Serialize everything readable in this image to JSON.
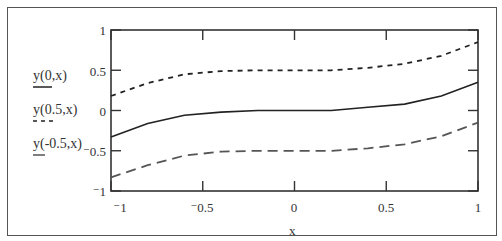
{
  "chart_data": {
    "type": "line",
    "title": "",
    "xlabel": "x",
    "ylabel": "",
    "xlim": [
      -1,
      1
    ],
    "ylim": [
      -1,
      1
    ],
    "grid": false,
    "legend_position": "left",
    "x_ticks": [
      "-1",
      "-0.5",
      "0",
      "0.5",
      "1"
    ],
    "y_ticks": [
      "1",
      "0.5",
      "0",
      "-0.5",
      "-1"
    ],
    "x": [
      -1,
      -0.8,
      -0.6,
      -0.4,
      -0.2,
      0,
      0.2,
      0.4,
      0.6,
      0.8,
      1
    ],
    "series": [
      {
        "name": "y(0,x)",
        "style": "solid",
        "color": "#222222",
        "values": [
          -0.33,
          -0.16,
          -0.06,
          -0.02,
          0,
          0,
          0,
          0.04,
          0.08,
          0.18,
          0.35
        ]
      },
      {
        "name": "y(0.5,x)",
        "style": "short-dash",
        "color": "#222222",
        "values": [
          0.18,
          0.34,
          0.45,
          0.49,
          0.5,
          0.5,
          0.5,
          0.53,
          0.58,
          0.68,
          0.85
        ]
      },
      {
        "name": "y(-0.5,x)",
        "style": "long-dash",
        "color": "#555555",
        "values": [
          -0.83,
          -0.68,
          -0.56,
          -0.51,
          -0.5,
          -0.5,
          -0.5,
          -0.47,
          -0.42,
          -0.32,
          -0.15
        ]
      }
    ]
  },
  "legend": {
    "items": [
      {
        "label": "y(0,x)"
      },
      {
        "label": "y(0.5,x)"
      },
      {
        "label": "y(-0.5,x)"
      }
    ]
  },
  "axes": {
    "x_title": "x",
    "y_tick_labels": [
      "1",
      "0.5",
      "0",
      "⁻0.5",
      "⁻1"
    ],
    "x_tick_labels": [
      "⁻1",
      "⁻0.5",
      "0",
      "0.5",
      "1"
    ]
  }
}
